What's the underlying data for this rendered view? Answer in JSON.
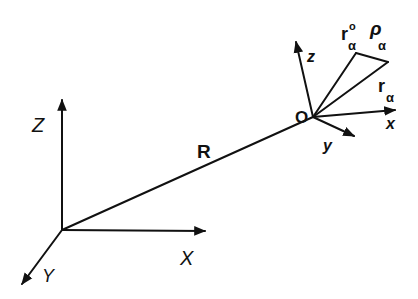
{
  "diagram": {
    "global_frame": {
      "axes": {
        "x_label": "X",
        "y_label": "Y",
        "z_label": "Z"
      }
    },
    "position_vector": {
      "label": "R"
    },
    "local_frame": {
      "origin_label": "O",
      "axes": {
        "x_label": "x",
        "y_label": "y",
        "z_label": "z"
      }
    },
    "vectors": {
      "r0": {
        "base": "r",
        "sub": "α",
        "sup": "o"
      },
      "rho": {
        "base": "ρ",
        "sub": "α"
      },
      "r": {
        "base": "r",
        "sub": "α"
      }
    },
    "colors": {
      "ink": "#111111",
      "background": "#ffffff"
    }
  }
}
